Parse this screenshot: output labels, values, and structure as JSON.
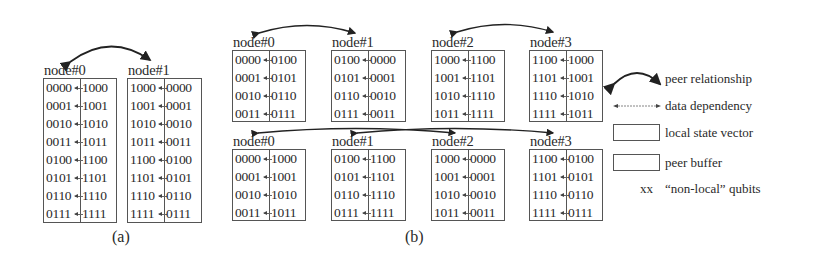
{
  "figure": {
    "panels": [
      {
        "caption": "(a)",
        "nodes": [
          {
            "label": "node#0",
            "rows": [
              [
                "0000",
                "1000"
              ],
              [
                "0001",
                "1001"
              ],
              [
                "0010",
                "1010"
              ],
              [
                "0011",
                "1011"
              ],
              [
                "0100",
                "1100"
              ],
              [
                "0101",
                "1101"
              ],
              [
                "0110",
                "1110"
              ],
              [
                "0111",
                "1111"
              ]
            ]
          },
          {
            "label": "node#1",
            "rows": [
              [
                "1000",
                "0000"
              ],
              [
                "1001",
                "0001"
              ],
              [
                "1010",
                "0010"
              ],
              [
                "1011",
                "0011"
              ],
              [
                "1100",
                "0100"
              ],
              [
                "1101",
                "0101"
              ],
              [
                "1110",
                "0110"
              ],
              [
                "1111",
                "0111"
              ]
            ]
          }
        ],
        "peer_pairs": [
          [
            "node#0",
            "node#1"
          ]
        ]
      },
      {
        "caption": "(b)",
        "stages": [
          {
            "nodes": [
              {
                "label": "node#0",
                "rows": [
                  [
                    "0000",
                    "0100"
                  ],
                  [
                    "0001",
                    "0101"
                  ],
                  [
                    "0010",
                    "0110"
                  ],
                  [
                    "0011",
                    "0111"
                  ]
                ]
              },
              {
                "label": "node#1",
                "rows": [
                  [
                    "0100",
                    "0000"
                  ],
                  [
                    "0101",
                    "0001"
                  ],
                  [
                    "0110",
                    "0010"
                  ],
                  [
                    "0111",
                    "0011"
                  ]
                ]
              },
              {
                "label": "node#2",
                "rows": [
                  [
                    "1000",
                    "1100"
                  ],
                  [
                    "1001",
                    "1101"
                  ],
                  [
                    "1010",
                    "1110"
                  ],
                  [
                    "1011",
                    "1111"
                  ]
                ]
              },
              {
                "label": "node#3",
                "rows": [
                  [
                    "1100",
                    "1000"
                  ],
                  [
                    "1101",
                    "1001"
                  ],
                  [
                    "1110",
                    "1010"
                  ],
                  [
                    "1111",
                    "1011"
                  ]
                ]
              }
            ],
            "peer_pairs": [
              [
                "node#0",
                "node#1"
              ],
              [
                "node#2",
                "node#3"
              ]
            ]
          },
          {
            "nodes": [
              {
                "label": "node#0",
                "rows": [
                  [
                    "0000",
                    "1000"
                  ],
                  [
                    "0001",
                    "1001"
                  ],
                  [
                    "0010",
                    "1010"
                  ],
                  [
                    "0011",
                    "1011"
                  ]
                ]
              },
              {
                "label": "node#1",
                "rows": [
                  [
                    "0100",
                    "1100"
                  ],
                  [
                    "0101",
                    "1101"
                  ],
                  [
                    "0110",
                    "1110"
                  ],
                  [
                    "0111",
                    "1111"
                  ]
                ]
              },
              {
                "label": "node#2",
                "rows": [
                  [
                    "1000",
                    "0000"
                  ],
                  [
                    "1001",
                    "0001"
                  ],
                  [
                    "1010",
                    "0010"
                  ],
                  [
                    "1011",
                    "0011"
                  ]
                ]
              },
              {
                "label": "node#3",
                "rows": [
                  [
                    "1100",
                    "0100"
                  ],
                  [
                    "1101",
                    "0101"
                  ],
                  [
                    "1110",
                    "0110"
                  ],
                  [
                    "1111",
                    "0111"
                  ]
                ]
              }
            ],
            "peer_pairs": [
              [
                "node#0",
                "node#2"
              ],
              [
                "node#1",
                "node#3"
              ]
            ]
          }
        ]
      }
    ],
    "legend": {
      "peer_relationship": "peer relationship",
      "data_dependency": "data dependency",
      "local_state_vector": "local state vector",
      "peer_buffer": "peer buffer",
      "non_local_marker": "xx",
      "non_local_qubits": "“non-local” qubits"
    }
  }
}
